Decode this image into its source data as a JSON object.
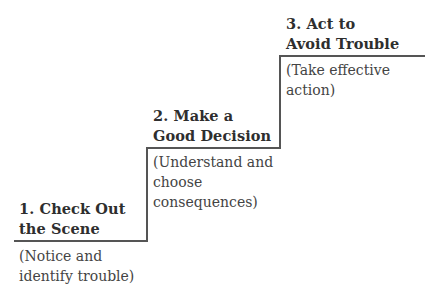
{
  "steps": [
    {
      "title_line1": "1. Check Out",
      "title_line2": "the Scene",
      "desc_line1": "(Notice and",
      "desc_line2": "identify trouble)",
      "desc_line3": ""
    },
    {
      "title_line1": "2. Make a",
      "title_line2": "Good Decision",
      "desc_line1": "(Understand and",
      "desc_line2": "choose",
      "desc_line3": "consequences)"
    },
    {
      "title_line1": "3. Act to",
      "title_line2": "Avoid Trouble",
      "desc_line1": "(Take effective",
      "desc_line2": "action)",
      "desc_line3": ""
    }
  ],
  "colors": {
    "line": "#555555",
    "text": "#3a3a3a"
  }
}
